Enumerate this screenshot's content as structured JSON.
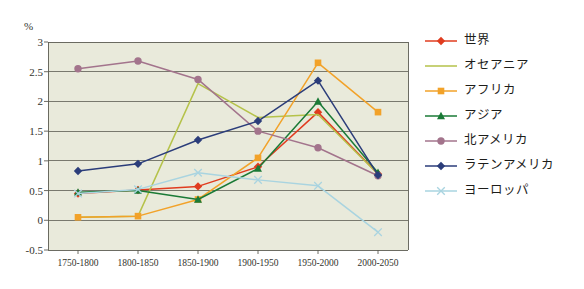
{
  "axis": {
    "unit_label": "%",
    "y_ticks": [
      "3",
      "2.5",
      "2",
      "1.5",
      "1",
      "0.5",
      "0",
      "-0.5"
    ],
    "x_ticks": [
      "1750-1800",
      "1800-1850",
      "1850-1900",
      "1900-1950",
      "1950-2000",
      "2000-2050"
    ]
  },
  "legend": {
    "items": [
      {
        "label": "世界",
        "color": "#e03c1f",
        "marker": "diamond"
      },
      {
        "label": "オセアニア",
        "color": "#b5c24a",
        "marker": "none"
      },
      {
        "label": "アフリカ",
        "color": "#f2a229",
        "marker": "square"
      },
      {
        "label": "アジア",
        "color": "#1a7a36",
        "marker": "triangle"
      },
      {
        "label": "北アメリカ",
        "color": "#a3748c",
        "marker": "circle"
      },
      {
        "label": "ラテンアメリカ",
        "color": "#2b3d7a",
        "marker": "diamond"
      },
      {
        "label": "ヨーロッパ",
        "color": "#a9d4e0",
        "marker": "cross"
      }
    ]
  },
  "chart_data": {
    "type": "line",
    "title": "",
    "xlabel": "",
    "ylabel": "%",
    "ylim": [
      -0.5,
      3
    ],
    "grid": true,
    "legend_position": "right",
    "categories": [
      "1750-1800",
      "1800-1850",
      "1850-1900",
      "1900-1950",
      "1950-2000",
      "2000-2050"
    ],
    "series": [
      {
        "name": "世界",
        "color": "#e03c1f",
        "marker": "diamond",
        "values": [
          0.45,
          0.51,
          0.57,
          0.9,
          1.82,
          0.78
        ]
      },
      {
        "name": "オセアニア",
        "color": "#b5c24a",
        "marker": "none",
        "values": [
          0.05,
          0.07,
          2.3,
          1.73,
          1.78,
          0.78
        ]
      },
      {
        "name": "アフリカ",
        "color": "#f2a229",
        "marker": "square",
        "values": [
          0.05,
          0.07,
          0.35,
          1.05,
          2.65,
          1.82
        ]
      },
      {
        "name": "アジア",
        "color": "#1a7a36",
        "marker": "triangle",
        "values": [
          0.47,
          0.5,
          0.35,
          0.87,
          2.0,
          0.8
        ]
      },
      {
        "name": "北アメリカ",
        "color": "#a3748c",
        "marker": "circle",
        "values": [
          2.55,
          2.68,
          2.37,
          1.5,
          1.22,
          0.75
        ]
      },
      {
        "name": "ラテンアメリカ",
        "color": "#2b3d7a",
        "marker": "diamond",
        "values": [
          0.83,
          0.95,
          1.35,
          1.67,
          2.35,
          0.76
        ]
      },
      {
        "name": "ヨーロッパ",
        "color": "#a9d4e0",
        "marker": "cross",
        "values": [
          0.45,
          0.52,
          0.8,
          0.68,
          0.58,
          -0.2
        ]
      }
    ]
  }
}
